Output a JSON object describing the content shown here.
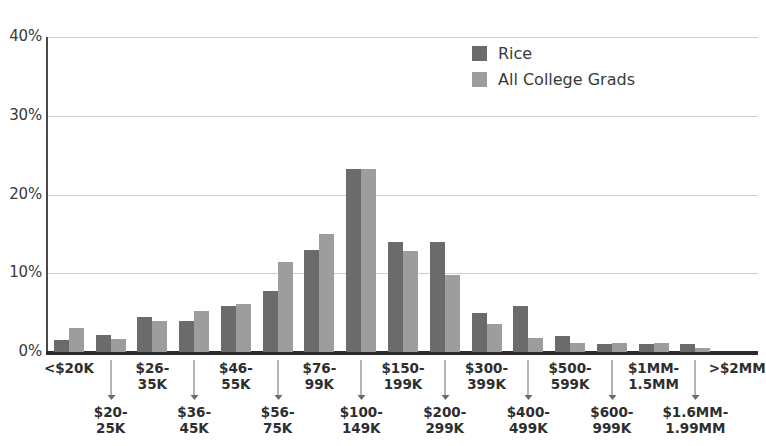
{
  "chart_data": {
    "type": "bar",
    "title": "",
    "subtitle": "",
    "xlabel": "",
    "ylabel": "",
    "ylim": [
      0,
      40
    ],
    "ytick_labels": [
      "40%",
      "30%",
      "20%",
      "10%",
      "0%"
    ],
    "ytick_values": [
      40,
      30,
      20,
      10,
      0
    ],
    "grid": true,
    "legend_position": "top-right",
    "categories": [
      "<$20K",
      "$20-25K",
      "$26-35K",
      "$36-45K",
      "$46-55K",
      "$56-75K",
      "$76-99K",
      "$100-149K",
      "$150-199K",
      "$200-299K",
      "$300-399K",
      "$400-499K",
      "$500-599K",
      "$600-999K",
      "$1MM-1.5MM",
      "$1.6MM-1.99MM",
      ">$2MM"
    ],
    "category_lines": [
      [
        "<$20K"
      ],
      [
        "$20-",
        "25K"
      ],
      [
        "$26-",
        "35K"
      ],
      [
        "$36-",
        "45K"
      ],
      [
        "$46-",
        "55K"
      ],
      [
        "$56-",
        "75K"
      ],
      [
        "$76-",
        "99K"
      ],
      [
        "$100-",
        "149K"
      ],
      [
        "$150-",
        "199K"
      ],
      [
        "$200-",
        "299K"
      ],
      [
        "$300-",
        "399K"
      ],
      [
        "$400-",
        "499K"
      ],
      [
        "$500-",
        "599K"
      ],
      [
        "$600-",
        "999K"
      ],
      [
        "$1MM-",
        "1.5MM"
      ],
      [
        "$1.6MM-",
        "1.99MM"
      ],
      [
        ">$2MM"
      ]
    ],
    "category_rows": [
      "top",
      "bottom",
      "top",
      "bottom",
      "top",
      "bottom",
      "top",
      "bottom",
      "top",
      "bottom",
      "top",
      "bottom",
      "top",
      "bottom",
      "top",
      "bottom",
      "top"
    ],
    "series": [
      {
        "name": "Rice",
        "color": "#6b6b6b",
        "values": [
          1.5,
          2.2,
          4.5,
          3.9,
          5.8,
          7.8,
          13.0,
          23.3,
          14.0,
          14.0,
          5.0,
          5.8,
          2.0,
          1.0,
          1.0,
          1.0,
          0.0
        ]
      },
      {
        "name": "All College Grads",
        "color": "#9d9d9d",
        "values": [
          3.0,
          1.7,
          4.0,
          5.2,
          6.1,
          11.4,
          15.0,
          23.3,
          12.8,
          9.8,
          3.5,
          1.8,
          1.2,
          1.2,
          1.2,
          0.5,
          0.0
        ]
      }
    ]
  },
  "legend": {
    "items": [
      {
        "label": "Rice",
        "color": "#6b6b6b"
      },
      {
        "label": "All College Grads",
        "color": "#9d9d9d"
      }
    ]
  },
  "colors": {
    "rice": "#6b6b6b",
    "all_college_grads": "#9d9d9d",
    "gridline": "#cfcfcf",
    "axis": "#2b2b2b",
    "text": "#2e2e2e",
    "background": "#ffffff"
  }
}
